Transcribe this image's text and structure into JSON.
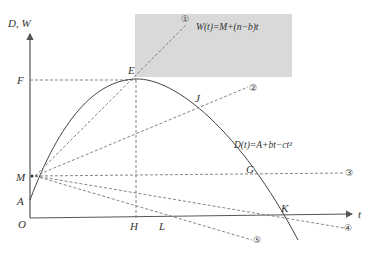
{
  "diagram": {
    "axes": {
      "y_label": "D, W",
      "x_label": "t",
      "origin_label": "O"
    },
    "y_axis_points": [
      {
        "id": "F",
        "label": "F"
      },
      {
        "id": "M",
        "label": "M"
      },
      {
        "id": "A",
        "label": "A"
      }
    ],
    "x_axis_points": [
      {
        "id": "H",
        "label": "H"
      },
      {
        "id": "L",
        "label": "L"
      },
      {
        "id": "K",
        "label": "K"
      }
    ],
    "curve_points": [
      {
        "id": "E",
        "label": "E"
      },
      {
        "id": "J",
        "label": "J"
      },
      {
        "id": "G",
        "label": "G"
      }
    ],
    "formulas": {
      "W": "W(t)=M+(n−b)t",
      "D": "D(t)=A+bt−ct²"
    },
    "line_markers": [
      "①",
      "②",
      "③",
      "④",
      "⑤"
    ],
    "colors": {
      "shaded_box": "#d9d9d9",
      "lines": "#555555",
      "dashed": "#777777"
    }
  }
}
